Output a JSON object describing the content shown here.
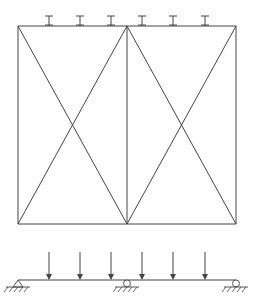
{
  "diagram": {
    "type": "structural-frame-and-beam",
    "colors": {
      "stroke": "#444444",
      "background": "#ffffff"
    },
    "frame": {
      "left_x": 18,
      "mid_x": 127,
      "right_x": 236,
      "top_y": 26,
      "bottom_y": 224,
      "panels": 2,
      "diagonal_bracing": "X in each panel"
    },
    "top_loads": {
      "symbol": "I-load-marker",
      "count": 6,
      "x": [
        49,
        80,
        111,
        142,
        173,
        205
      ],
      "top_y": 16,
      "bottom_y": 26
    },
    "beam": {
      "y": 280,
      "start_x": 18,
      "end_x": 236,
      "point_loads": {
        "count": 6,
        "x": [
          49,
          80,
          111,
          142,
          173,
          205
        ],
        "arrow_top_y": 252
      },
      "supports": [
        {
          "type": "pin",
          "x": 18
        },
        {
          "type": "roller",
          "x": 127
        },
        {
          "type": "roller",
          "x": 236
        }
      ]
    }
  }
}
